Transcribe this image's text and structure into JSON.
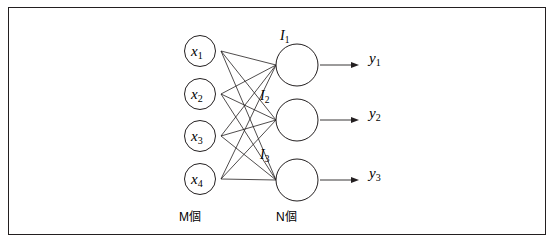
{
  "figure": {
    "type": "neural-network-diagram",
    "border_color": "#231f20",
    "stroke_color": "#231f20",
    "background": "#ffffff",
    "input_nodes": [
      {
        "label": "x",
        "sub": "1"
      },
      {
        "label": "x",
        "sub": "2"
      },
      {
        "label": "x",
        "sub": "3"
      },
      {
        "label": "x",
        "sub": "4"
      }
    ],
    "hidden_nodes": [
      {
        "label": "I",
        "sub": "1"
      },
      {
        "label": "I",
        "sub": "2"
      },
      {
        "label": "I",
        "sub": "3"
      }
    ],
    "output_labels": [
      {
        "label": "y",
        "sub": "1"
      },
      {
        "label": "y",
        "sub": "2"
      },
      {
        "label": "y",
        "sub": "3"
      }
    ],
    "layer_captions": {
      "input": "M個",
      "hidden": "N個"
    }
  }
}
